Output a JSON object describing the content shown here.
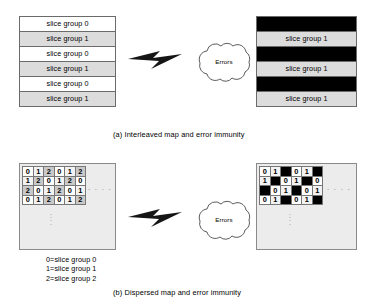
{
  "figure": {
    "title_a": "(a) Interleaved map and error immunity",
    "title_b": "(b) Dispersed map and error immunity",
    "cloud_label": "Errors",
    "ellipsis_horizontal": ". . . .",
    "ellipsis_vertical": ". . . ."
  },
  "interleaved": {
    "source_rows": [
      {
        "label": "slice group 0",
        "fill": "white"
      },
      {
        "label": "slice group 1",
        "fill": "gray"
      },
      {
        "label": "slice group 0",
        "fill": "white"
      },
      {
        "label": "slice group 1",
        "fill": "gray"
      },
      {
        "label": "slice group 0",
        "fill": "white"
      },
      {
        "label": "slice group 1",
        "fill": "gray"
      }
    ],
    "received_rows": [
      {
        "label": "slice group 0",
        "fill": "black"
      },
      {
        "label": "slice group 1",
        "fill": "gray"
      },
      {
        "label": "slice group 0",
        "fill": "black"
      },
      {
        "label": "slice group 1",
        "fill": "gray"
      },
      {
        "label": "slice group 0",
        "fill": "black"
      },
      {
        "label": "slice group 1",
        "fill": "gray"
      }
    ]
  },
  "dispersed": {
    "source_grid": [
      [
        "0",
        "1",
        "2",
        "0",
        "1",
        "2"
      ],
      [
        "1",
        "2",
        "0",
        "1",
        "2",
        "0"
      ],
      [
        "2",
        "0",
        "1",
        "2",
        "0",
        "1"
      ],
      [
        "0",
        "1",
        "2",
        "0",
        "1",
        "2"
      ]
    ],
    "received_grid": [
      [
        "0",
        "1",
        "",
        "0",
        "1",
        ""
      ],
      [
        "1",
        "",
        "0",
        "1",
        "",
        "0"
      ],
      [
        "",
        "0",
        "1",
        "",
        "0",
        "1"
      ],
      [
        "0",
        "1",
        "",
        "0",
        "1",
        ""
      ]
    ],
    "legend": [
      "0=slice group 0",
      "1=slice group 1",
      "2=slice group 2"
    ]
  },
  "colors": {
    "gray_fill": "#dcdcdc",
    "black_fill": "#000000",
    "panel_fill": "#ececec",
    "border": "#6b6b6b"
  }
}
